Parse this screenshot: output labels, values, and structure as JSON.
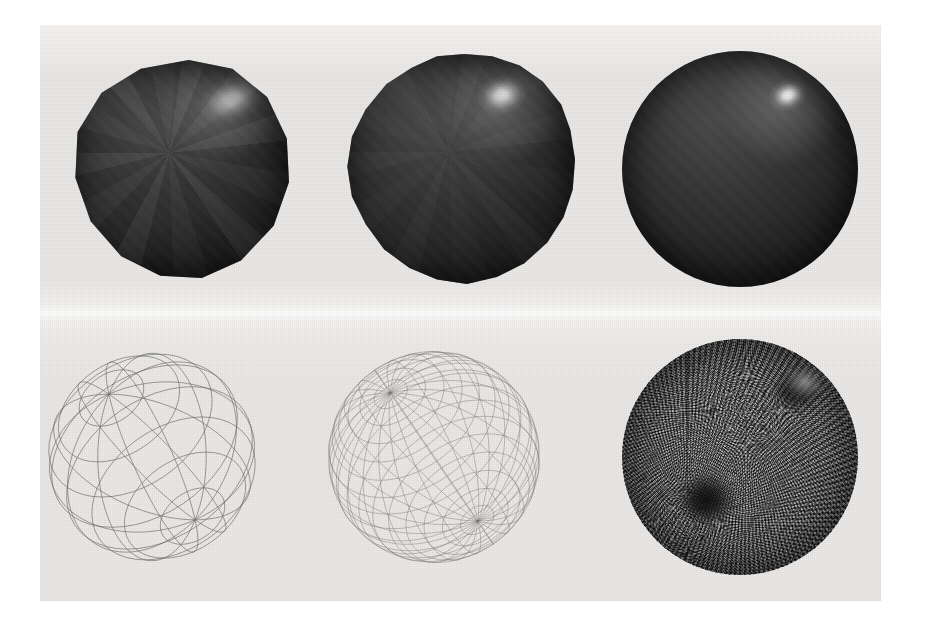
{
  "figure": {
    "kind": "scanned-photographic-plate",
    "caption": "",
    "page_background": "#ffffff",
    "plate_background": "#ebe9e7",
    "plate_rect": {
      "x": 40,
      "y": 25,
      "width": 841,
      "height": 576
    },
    "rows": 2,
    "columns": 3,
    "wire_color": "#5b5b5b",
    "sphere_color": "#2c2c2c",
    "highlight_color": "#ffffff"
  },
  "panels": [
    {
      "id": "shaded-coarse",
      "row": "top",
      "column": 1,
      "render_mode": "shaded",
      "tessellation": "coarse",
      "silhouette": "faceted-polygon",
      "facets_visible": true,
      "highlight": "broad-diffuse-clipped",
      "label": "",
      "diameter": 218,
      "center": {
        "x": 188,
        "y": 175
      }
    },
    {
      "id": "shaded-medium",
      "row": "top",
      "column": 2,
      "render_mode": "shaded",
      "tessellation": "medium",
      "silhouette": "slightly-faceted",
      "facets_visible": false,
      "highlight": "soft-rounded",
      "label": "",
      "diameter": 230,
      "center": {
        "x": 470,
        "y": 174
      }
    },
    {
      "id": "shaded-fine",
      "row": "top",
      "column": 3,
      "render_mode": "shaded",
      "tessellation": "fine",
      "silhouette": "smooth-circle",
      "facets_visible": false,
      "highlight": "tight-bright-specular",
      "label": "",
      "diameter": 236,
      "center": {
        "x": 752,
        "y": 172
      }
    },
    {
      "id": "wire-coarse",
      "row": "bottom",
      "column": 1,
      "render_mode": "wireframe",
      "tessellation": "coarse",
      "meridians": 12,
      "parallels": 9,
      "label": "",
      "diameter": 224,
      "center": {
        "x": 182,
        "y": 460
      }
    },
    {
      "id": "wire-medium",
      "row": "bottom",
      "column": 2,
      "render_mode": "wireframe",
      "tessellation": "medium",
      "meridians": 24,
      "parallels": 18,
      "label": "",
      "diameter": 228,
      "center": {
        "x": 464,
        "y": 458
      }
    },
    {
      "id": "wire-fine",
      "row": "bottom",
      "column": 3,
      "render_mode": "wireframe",
      "tessellation": "fine",
      "meridians": 120,
      "parallels": 90,
      "appearance": "dense-moire-mass",
      "label": "",
      "diameter": 236,
      "center": {
        "x": 750,
        "y": 456
      }
    }
  ]
}
